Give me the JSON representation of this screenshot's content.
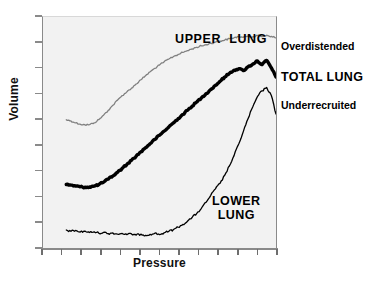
{
  "chart_data": {
    "type": "line",
    "title": "",
    "xlabel": "Pressure",
    "ylabel": "Volume",
    "xlim": [
      0,
      100
    ],
    "ylim": [
      0,
      100
    ],
    "grid": false,
    "legend_position": "inline-annotations",
    "axis_ticks": {
      "x_tick_count": 13,
      "y_tick_count": 10,
      "x_tick_labels": [],
      "y_tick_labels": []
    },
    "annotations": [
      {
        "name": "upper-lung",
        "text": "UPPER  LUNG",
        "placement": "inside-top"
      },
      {
        "name": "lower-lung",
        "text": "LOWER\nLUNG",
        "placement": "inside-bottom-right"
      },
      {
        "name": "overdistended",
        "text": "Overdistended",
        "placement": "right-of-axis"
      },
      {
        "name": "total-lung",
        "text": "TOTAL LUNG",
        "placement": "right-of-axis"
      },
      {
        "name": "underrecruited",
        "text": "Underrecruited",
        "placement": "right-of-axis"
      }
    ],
    "series": [
      {
        "name": "Upper lung",
        "color": "#808080",
        "width": 1.3,
        "x": [
          10,
          12,
          14,
          16,
          18,
          20,
          22,
          24,
          26,
          28,
          30,
          32,
          34,
          36,
          38,
          40,
          42,
          44,
          46,
          48,
          50,
          52,
          54,
          56,
          58,
          60,
          62,
          64,
          66,
          68,
          70,
          72,
          74,
          76,
          78,
          80,
          82,
          84,
          86,
          88,
          90,
          92,
          94,
          96,
          98,
          100
        ],
        "y": [
          55.5,
          55.0,
          54.2,
          53.6,
          53.3,
          53.4,
          54.2,
          55.6,
          57.5,
          59.6,
          61.8,
          64.0,
          66.0,
          67.6,
          69.2,
          71.0,
          72.8,
          74.6,
          76.3,
          77.8,
          79.2,
          80.6,
          81.8,
          82.9,
          83.8,
          84.7,
          85.4,
          86.2,
          86.9,
          87.5,
          88.0,
          88.6,
          89.1,
          89.6,
          90.0,
          90.6,
          91.0,
          91.5,
          91.2,
          91.8,
          91.4,
          92.0,
          91.5,
          92.1,
          91.6,
          91.0
        ]
      },
      {
        "name": "Total lung",
        "color": "#000000",
        "width": 3.4,
        "x": [
          10,
          12,
          14,
          16,
          18,
          20,
          22,
          24,
          26,
          28,
          30,
          32,
          34,
          36,
          38,
          40,
          42,
          44,
          46,
          48,
          50,
          52,
          54,
          56,
          58,
          60,
          62,
          64,
          66,
          68,
          70,
          72,
          74,
          76,
          78,
          80,
          82,
          84,
          86,
          88,
          90,
          92,
          94,
          96,
          98,
          100
        ],
        "y": [
          27.5,
          27.2,
          26.8,
          26.5,
          26.3,
          26.4,
          26.8,
          27.5,
          28.5,
          29.8,
          31.2,
          32.8,
          34.5,
          36.2,
          38.0,
          39.8,
          41.6,
          43.4,
          45.2,
          47.0,
          48.8,
          50.6,
          52.4,
          54.2,
          56.0,
          57.8,
          59.6,
          61.4,
          63.2,
          65.0,
          66.8,
          68.6,
          70.4,
          72.2,
          74.0,
          75.6,
          77.0,
          77.6,
          76.8,
          78.4,
          79.6,
          81.0,
          79.4,
          81.2,
          78.0,
          74.0
        ]
      },
      {
        "name": "Lower lung",
        "color": "#000000",
        "width": 1.3,
        "x": [
          10,
          12,
          14,
          16,
          18,
          20,
          22,
          24,
          26,
          28,
          30,
          32,
          34,
          36,
          38,
          40,
          42,
          44,
          46,
          48,
          50,
          52,
          54,
          56,
          58,
          60,
          62,
          64,
          66,
          68,
          70,
          72,
          74,
          76,
          78,
          80,
          82,
          84,
          86,
          88,
          90,
          92,
          94,
          96,
          98,
          100
        ],
        "y": [
          7.8,
          7.2,
          7.6,
          6.9,
          7.3,
          6.7,
          7.0,
          6.4,
          6.8,
          6.2,
          6.5,
          6.0,
          6.3,
          5.8,
          6.1,
          5.6,
          6.0,
          5.5,
          5.9,
          6.4,
          5.8,
          6.6,
          7.2,
          8.0,
          9.0,
          10.2,
          11.6,
          13.2,
          15.0,
          17.2,
          19.8,
          22.8,
          25.6,
          28.0,
          31.5,
          35.5,
          40.0,
          45.0,
          50.5,
          56.0,
          61.0,
          65.5,
          68.0,
          69.5,
          66.0,
          58.0
        ]
      }
    ]
  },
  "axes": {
    "y_label": "Volume",
    "x_label": "Pressure"
  },
  "labels": {
    "upper_lung": "UPPER  LUNG",
    "lower_lung_line1": "LOWER",
    "lower_lung_line2": "LUNG",
    "overdistended": "Overdistended",
    "total_lung": "TOTAL LUNG",
    "underrecruited": "Underrecruited"
  },
  "colors": {
    "plot_background": "#f2f2f2",
    "axis": "#8a8a8a",
    "upper_lung_curve": "#808080",
    "total_lung_curve": "#000000",
    "lower_lung_curve": "#000000",
    "text": "#000000"
  }
}
